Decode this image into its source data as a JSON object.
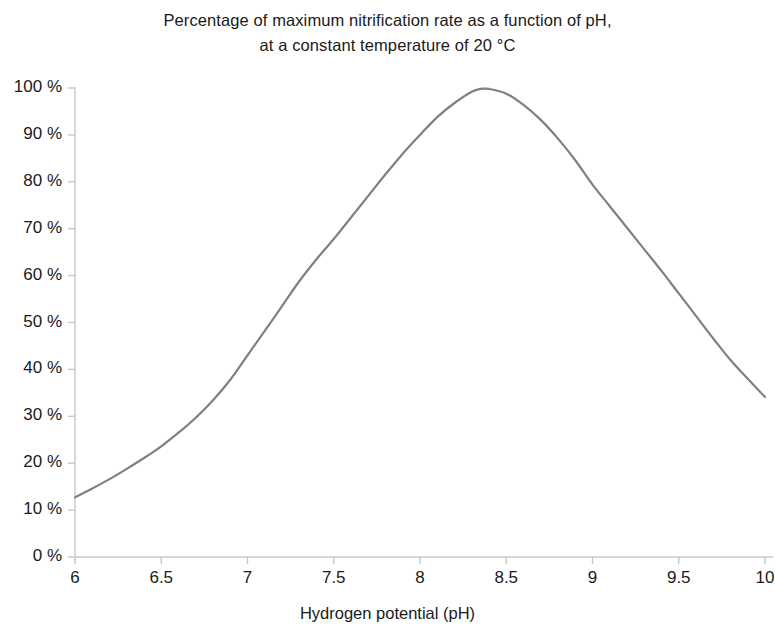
{
  "chart_data": {
    "type": "line",
    "title": "Percentage of maximum nitrification rate as a function of pH, at a constant temperature of 20 °C",
    "title_lines": [
      "Percentage of maximum nitrification rate as a function of pH,",
      "at a constant temperature of 20 °C"
    ],
    "xlabel": "Hydrogen potential (pH)",
    "ylabel": "",
    "xlim": [
      6,
      10
    ],
    "ylim": [
      0,
      100
    ],
    "grid": false,
    "legend": false,
    "legend_position": "none",
    "line_color": "#808080",
    "axis_color": "#c8c8c8",
    "x_ticks": [
      6,
      6.5,
      7,
      7.5,
      8,
      8.5,
      9,
      9.5,
      10
    ],
    "x_tick_labels": [
      "6",
      "6.5",
      "7",
      "7.5",
      "8",
      "8.5",
      "9",
      "9.5",
      "10"
    ],
    "y_ticks": [
      0,
      10,
      20,
      30,
      40,
      50,
      60,
      70,
      80,
      90,
      100
    ],
    "y_tick_labels": [
      "0 %",
      "10 %",
      "20 %",
      "30 %",
      "40 %",
      "50 %",
      "60 %",
      "70 %",
      "80 %",
      "90 %",
      "100 %"
    ],
    "x": [
      6.0,
      6.1,
      6.2,
      6.3,
      6.4,
      6.5,
      6.6,
      6.7,
      6.8,
      6.9,
      7.0,
      7.1,
      7.2,
      7.3,
      7.4,
      7.5,
      7.6,
      7.7,
      7.8,
      7.9,
      8.0,
      8.1,
      8.2,
      8.3,
      8.35,
      8.4,
      8.5,
      8.6,
      8.7,
      8.8,
      8.9,
      9.0,
      9.1,
      9.2,
      9.3,
      9.4,
      9.5,
      9.6,
      9.7,
      9.8,
      9.9,
      10.0
    ],
    "values": [
      12.7,
      14.6,
      16.6,
      18.8,
      21.1,
      23.6,
      26.5,
      29.7,
      33.4,
      37.8,
      43.0,
      48.2,
      53.5,
      58.8,
      63.5,
      67.8,
      72.4,
      77.0,
      81.6,
      86.0,
      90.0,
      93.8,
      96.8,
      99.2,
      99.8,
      99.8,
      98.8,
      96.4,
      93.2,
      89.2,
      84.6,
      79.4,
      74.8,
      70.2,
      65.6,
      61.0,
      56.2,
      51.4,
      46.6,
      42.0,
      38.0,
      34.1
    ],
    "series": [
      {
        "name": "Nitrification rate (% of maximum)",
        "values": [
          12.7,
          14.6,
          16.6,
          18.8,
          21.1,
          23.6,
          26.5,
          29.7,
          33.4,
          37.8,
          43.0,
          48.2,
          53.5,
          58.8,
          63.5,
          67.8,
          72.4,
          77.0,
          81.6,
          86.0,
          90.0,
          93.8,
          96.8,
          99.2,
          99.8,
          99.8,
          98.8,
          96.4,
          93.2,
          89.2,
          84.6,
          79.4,
          74.8,
          70.2,
          65.6,
          61.0,
          56.2,
          51.4,
          46.6,
          42.0,
          38.0,
          34.1
        ]
      }
    ],
    "peak": {
      "x": 8.35,
      "y": 100
    }
  }
}
